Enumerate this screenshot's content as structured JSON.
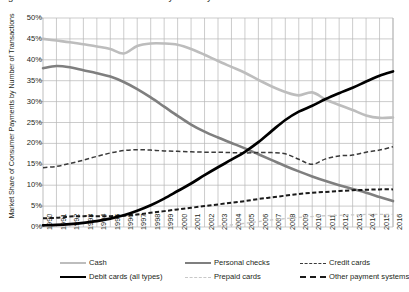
{
  "title": "Figure 1. Market Share of Consumer Payments by Number of Transactions",
  "axes": {
    "ylabel": "Market Share of Consumer Payments by Number of Transactions",
    "xlabel": "",
    "ytick_labels": [
      "0%",
      "5%",
      "10%",
      "15%",
      "20%",
      "25%",
      "30%",
      "35%",
      "40%",
      "45%",
      "50%"
    ]
  },
  "legend": {
    "items": [
      {
        "label": "Cash",
        "color": "#bdbdbd",
        "style": "solid",
        "width": 2.6
      },
      {
        "label": "Personal checks",
        "color": "#7f7f7f",
        "style": "solid",
        "width": 2.6
      },
      {
        "label": "Credit cards",
        "color": "#3a3a3a",
        "style": "dashed",
        "width": 1.5
      },
      {
        "label": "Debit cards (all types)",
        "color": "#000000",
        "style": "solid",
        "width": 2.6
      },
      {
        "label": "Prepaid cards",
        "color": "#c8c8c8",
        "style": "dashed",
        "width": 1.3
      },
      {
        "label": "Other payment systems",
        "color": "#1a1a1a",
        "style": "dashed",
        "width": 2.0
      }
    ]
  },
  "chart_data": {
    "type": "line",
    "title": "Market Share of Consumer Payments by Number of Transactions",
    "xlabel": "",
    "ylabel": "Market Share of Consumer Payments by Number of Transactions",
    "ylim": [
      0,
      50
    ],
    "ytick_step": 5,
    "grid": true,
    "legend_position": "bottom",
    "x": [
      1990,
      1991,
      1992,
      1993,
      1994,
      1995,
      1996,
      1997,
      1998,
      1999,
      2000,
      2001,
      2002,
      2003,
      2004,
      2005,
      2006,
      2007,
      2008,
      2009,
      2010,
      2011,
      2012,
      2013,
      2014,
      2015,
      2016
    ],
    "series": [
      {
        "name": "Cash",
        "color": "#bdbdbd",
        "style": "solid",
        "values": [
          45.0,
          44.6,
          44.2,
          43.7,
          43.2,
          42.6,
          41.5,
          43.3,
          43.9,
          43.9,
          43.6,
          42.6,
          41.2,
          39.7,
          38.3,
          36.9,
          35.2,
          33.6,
          32.3,
          31.5,
          32.2,
          30.5,
          29.2,
          28.0,
          26.7,
          26.1,
          26.2
        ]
      },
      {
        "name": "Personal checks",
        "color": "#7f7f7f",
        "style": "solid",
        "values": [
          38.0,
          38.5,
          38.2,
          37.5,
          36.8,
          36.0,
          34.7,
          33.0,
          31.0,
          28.8,
          26.6,
          24.5,
          22.8,
          21.4,
          20.1,
          18.8,
          17.4,
          16.0,
          14.6,
          13.3,
          12.1,
          11.0,
          10.0,
          9.1,
          8.2,
          7.2,
          6.2
        ]
      },
      {
        "name": "Credit cards",
        "color": "#3a3a3a",
        "style": "dashed",
        "values": [
          14.2,
          14.5,
          15.2,
          16.0,
          16.9,
          17.7,
          18.3,
          18.5,
          18.4,
          18.2,
          18.1,
          18.0,
          17.9,
          17.9,
          17.8,
          17.7,
          17.8,
          17.8,
          17.5,
          16.2,
          15.0,
          16.3,
          17.0,
          17.2,
          17.9,
          18.4,
          19.2
        ]
      },
      {
        "name": "Debit cards (all types)",
        "color": "#000000",
        "style": "solid",
        "values": [
          0.4,
          0.5,
          0.7,
          1.0,
          1.4,
          2.0,
          2.8,
          3.9,
          5.2,
          6.8,
          8.6,
          10.4,
          12.4,
          14.3,
          16.1,
          18.0,
          20.3,
          23.0,
          25.6,
          27.6,
          29.0,
          30.6,
          32.0,
          33.3,
          34.8,
          36.2,
          37.2
        ]
      },
      {
        "name": "Prepaid cards",
        "color": "#c8c8c8",
        "style": "dashed",
        "values": [
          0,
          0,
          0,
          0,
          0,
          0,
          0,
          0,
          0,
          0,
          0,
          0,
          0,
          0.2,
          0.5,
          0.9,
          1.3,
          1.7,
          2.0,
          2.3,
          2.5,
          2.7,
          2.8,
          2.9,
          3.0,
          3.0,
          3.0
        ]
      },
      {
        "name": "Other payment systems",
        "color": "#1a1a1a",
        "style": "dashed",
        "values": [
          2.1,
          2.2,
          2.5,
          2.6,
          2.6,
          2.6,
          2.7,
          3.0,
          3.4,
          3.8,
          4.2,
          4.6,
          5.0,
          5.4,
          5.8,
          6.2,
          6.7,
          7.1,
          7.5,
          7.9,
          8.2,
          8.4,
          8.6,
          8.8,
          8.9,
          9.0,
          9.0
        ]
      }
    ]
  }
}
